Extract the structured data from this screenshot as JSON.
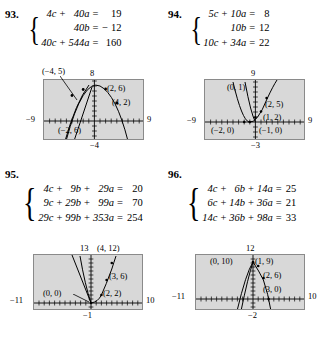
{
  "page": {
    "background": "#ffffff",
    "graph_bg": "#d8d8d8",
    "graph_border": "#8a8a8a"
  },
  "problems": [
    {
      "number": "93.",
      "equations": [
        {
          "t1": "4c",
          "op1": "+",
          "t2": "40a",
          "eq": "=",
          "rhs": "19"
        },
        {
          "t1": "",
          "op1": "",
          "t2": "40b",
          "eq": "=",
          "rhs": "− 12"
        },
        {
          "t1": "40c",
          "op1": "+",
          "t2": "544a",
          "eq": "=",
          "rhs": "160"
        }
      ],
      "graph": {
        "top_label": "8",
        "bottom_label": "−4",
        "left_label": "−9",
        "right_label": "9",
        "points": [
          {
            "label": "(−4, 5)",
            "x": -4,
            "y": 5
          },
          {
            "label": "(2, 6)",
            "x": 2,
            "y": 6
          },
          {
            "label": "(4, 2)",
            "x": 4,
            "y": 2
          },
          {
            "label": "(−2, 6)",
            "x": -2,
            "y": 6
          }
        ],
        "xrange": [
          -9,
          9
        ],
        "yrange": [
          -4,
          8
        ]
      }
    },
    {
      "number": "94.",
      "equations": [
        {
          "t1": "5c",
          "op1": "+",
          "t2": "10a",
          "eq": "=",
          "rhs": "8"
        },
        {
          "t1": "",
          "op1": "",
          "t2": "10b",
          "eq": "=",
          "rhs": "12"
        },
        {
          "t1": "10c",
          "op1": "+",
          "t2": "34a",
          "eq": "=",
          "rhs": "22"
        }
      ],
      "graph": {
        "top_label": "9",
        "bottom_label": "−3",
        "left_label": "−9",
        "right_label": "9",
        "points": [
          {
            "label": "(0, 1)",
            "x": 0,
            "y": 1
          },
          {
            "label": "(2, 5)",
            "x": 2,
            "y": 5
          },
          {
            "label": "(1, 2)",
            "x": 1,
            "y": 2
          },
          {
            "label": "(−2, 0)",
            "x": -2,
            "y": 0
          },
          {
            "label": "(−1, 0)",
            "x": -1,
            "y": 0
          }
        ],
        "xrange": [
          -9,
          9
        ],
        "yrange": [
          -3,
          9
        ]
      }
    },
    {
      "number": "95.",
      "equations": [
        {
          "t1": "4c",
          "op1": "+",
          "t2": "9b",
          "op2": "+",
          "t3": "29a",
          "eq": "=",
          "rhs": "20"
        },
        {
          "t1": "9c",
          "op1": "+",
          "t2": "29b",
          "op2": "+",
          "t3": "99a",
          "eq": "=",
          "rhs": "70"
        },
        {
          "t1": "29c",
          "op1": "+",
          "t2": "99b",
          "op2": "+",
          "t3": "353a",
          "eq": "=",
          "rhs": "254"
        }
      ],
      "graph": {
        "top_label": "13",
        "bottom_label": "−1",
        "left_label": "−11",
        "right_label": "10",
        "points": [
          {
            "label": "(4, 12)",
            "x": 4,
            "y": 12
          },
          {
            "label": "(3, 6)",
            "x": 3,
            "y": 6
          },
          {
            "label": "(2, 2)",
            "x": 2,
            "y": 2
          },
          {
            "label": "(0, 0)",
            "x": 0,
            "y": 0
          }
        ],
        "xrange": [
          -11,
          10
        ],
        "yrange": [
          -1,
          13
        ]
      }
    },
    {
      "number": "96.",
      "equations": [
        {
          "t1": "4c",
          "op1": "+",
          "t2": "6b",
          "op2": "+",
          "t3": "14a",
          "eq": "=",
          "rhs": "25"
        },
        {
          "t1": "6c",
          "op1": "+",
          "t2": "14b",
          "op2": "+",
          "t3": "36a",
          "eq": "=",
          "rhs": "21"
        },
        {
          "t1": "14c",
          "op1": "+",
          "t2": "36b",
          "op2": "+",
          "t3": "98a",
          "eq": "=",
          "rhs": "33"
        }
      ],
      "graph": {
        "top_label": "12",
        "bottom_label": "−2",
        "left_label": "−11",
        "right_label": "10",
        "points": [
          {
            "label": "(0, 10)",
            "x": 0,
            "y": 10
          },
          {
            "label": "(1, 9)",
            "x": 1,
            "y": 9
          },
          {
            "label": "(2, 6)",
            "x": 2,
            "y": 6
          },
          {
            "label": "(3, 0)",
            "x": 3,
            "y": 0
          }
        ],
        "xrange": [
          -11,
          10
        ],
        "yrange": [
          -2,
          12
        ]
      }
    }
  ]
}
